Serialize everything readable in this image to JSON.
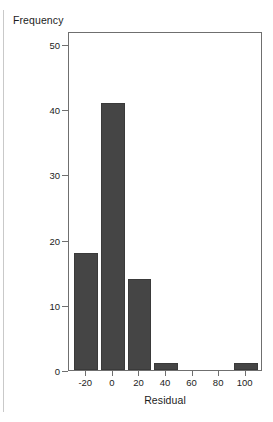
{
  "figure": {
    "background_color": "#ffffff",
    "frame_color": "#6f6f6f",
    "bar_color": "#454545",
    "text_color": "#1c1c1c",
    "left_rule_color": "#c9c9c9"
  },
  "axes": {
    "ylabel": "Frequency",
    "xlabel": "Residual",
    "yticks": [
      0,
      10,
      20,
      30,
      40,
      50
    ],
    "ytick_labels": [
      "0",
      "10",
      "20",
      "30",
      "40",
      "50"
    ],
    "xticks": [
      -20,
      0,
      20,
      40,
      60,
      80,
      100
    ],
    "xtick_labels": [
      "-20",
      "0",
      "20",
      "40",
      "60",
      "80",
      "100"
    ]
  },
  "chart_data": {
    "type": "bar",
    "title": "",
    "subtitle": "",
    "xlabel": "Residual",
    "ylabel": "Frequency",
    "categories": [
      "-20",
      "0",
      "20",
      "40",
      "60",
      "80",
      "100"
    ],
    "bin_centers": [
      -20,
      0,
      20,
      40,
      60,
      80,
      100
    ],
    "bin_width": 20,
    "values": [
      18,
      41,
      14,
      1,
      0,
      0,
      1
    ],
    "bars": [
      {
        "center": -20,
        "left": -30,
        "right": -10,
        "value": 18
      },
      {
        "center": 0,
        "left": -10,
        "right": 10,
        "value": 41
      },
      {
        "center": 20,
        "left": 10,
        "right": 30,
        "value": 14
      },
      {
        "center": 40,
        "left": 30,
        "right": 50,
        "value": 1
      },
      {
        "center": 60,
        "left": 50,
        "right": 70,
        "value": 0
      },
      {
        "center": 80,
        "left": 70,
        "right": 90,
        "value": 0
      },
      {
        "center": 100,
        "left": 90,
        "right": 110,
        "value": 1
      }
    ],
    "xlim": [
      -33,
      113
    ],
    "ylim": [
      0,
      52
    ],
    "grid": false,
    "legend": false,
    "legend_position": "none",
    "series": [
      {
        "name": "Frequency",
        "values": [
          18,
          41,
          14,
          1,
          0,
          0,
          1
        ]
      }
    ]
  }
}
